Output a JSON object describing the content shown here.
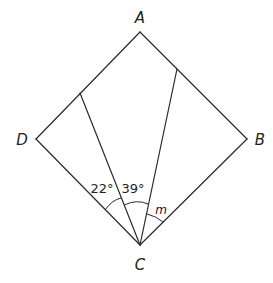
{
  "diagram": {
    "type": "geometry",
    "shape": "square ABCD with two segments from C to sides AD and AB",
    "vertices": {
      "A": {
        "label": "A"
      },
      "B": {
        "label": "B"
      },
      "C": {
        "label": "C"
      },
      "D": {
        "label": "D"
      }
    },
    "angles": [
      {
        "name": "angle-left",
        "label": "22°",
        "value_deg": 22
      },
      {
        "name": "angle-middle",
        "label": "39°",
        "value_deg": 39
      },
      {
        "name": "angle-right",
        "label": "m",
        "value_deg": null
      }
    ]
  }
}
